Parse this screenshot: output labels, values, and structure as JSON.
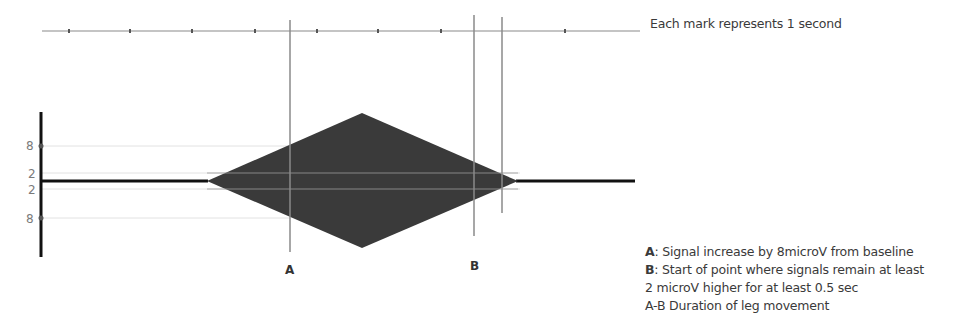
{
  "timeline": {
    "caption": "Each mark represents 1 second",
    "tick_count": 8,
    "tick_unit": "1 second"
  },
  "y_axis": {
    "labels": [
      "8",
      "2",
      "2",
      "8"
    ],
    "levels_microV": [
      8,
      2,
      -2,
      -8
    ]
  },
  "signal": {
    "shape": "diamond",
    "baseline_microV": 0,
    "peak_microV": 8,
    "color": "#3a3a3a"
  },
  "markers": [
    {
      "id": "A",
      "label": "A"
    },
    {
      "id": "B",
      "label": "B"
    },
    {
      "id": "B-end",
      "label": ""
    }
  ],
  "legend": {
    "rows": [
      {
        "key": "A",
        "text": ": Signal increase by 8microV from baseline"
      },
      {
        "key": "B",
        "text": ": Start of point where signals remain at least"
      },
      {
        "key": "",
        "text": "2 microV higher for at least 0.5 sec"
      },
      {
        "key": "",
        "text": "A-B Duration of leg movement"
      }
    ]
  },
  "colors": {
    "axis": "#111111",
    "gridline": "#e2e2e2",
    "marker_line": "#8a8a8a",
    "timeline": "#8a8a8a",
    "shape_fill": "#3a3a3a"
  }
}
